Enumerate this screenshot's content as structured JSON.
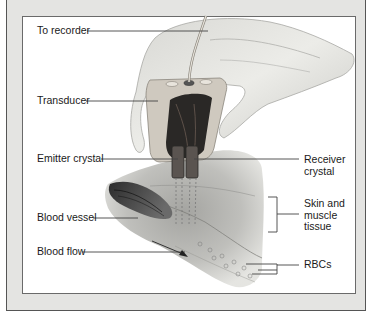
{
  "figure": {
    "labels_left": [
      {
        "id": "to-recorder",
        "text": "To recorder"
      },
      {
        "id": "transducer",
        "text": "Transducer"
      },
      {
        "id": "emitter-crystal",
        "text": "Emitter crystal"
      },
      {
        "id": "blood-vessel",
        "text": "Blood vessel"
      },
      {
        "id": "blood-flow",
        "text": "Blood flow"
      }
    ],
    "labels_right": [
      {
        "id": "receiver-crystal",
        "lines": [
          "Receiver",
          "crystal"
        ]
      },
      {
        "id": "skin-muscle",
        "lines": [
          "Skin and",
          "muscle",
          "tissue"
        ]
      },
      {
        "id": "rbcs",
        "lines": [
          "RBCs"
        ]
      }
    ]
  }
}
